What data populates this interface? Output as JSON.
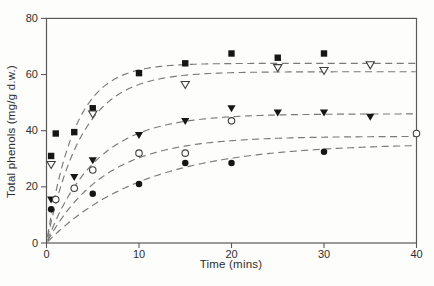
{
  "figure": {
    "x_axis_label": "Time (mins)",
    "y_axis_label": "Total phenols (mg/g d.w.)"
  },
  "chart_data": {
    "type": "scatter",
    "title": "",
    "xlabel": "Time (mins)",
    "ylabel": "Total phenols (mg/g d.w.)",
    "xlim": [
      0,
      40
    ],
    "ylim": [
      0,
      80
    ],
    "xticks": [
      0,
      10,
      20,
      30,
      40
    ],
    "yticks": [
      0,
      20,
      40,
      60,
      80
    ],
    "grid": false,
    "framed": true,
    "legend": "none",
    "curve_style": "dashed",
    "fit_model": "y = A * (1 - exp(-k * x))",
    "series": [
      {
        "name": "filled-square-series",
        "marker": "square",
        "fill": "filled",
        "points": [
          [
            0.5,
            31
          ],
          [
            1,
            39
          ],
          [
            3,
            39.5
          ],
          [
            5,
            48
          ],
          [
            10,
            60.5
          ],
          [
            15,
            64
          ],
          [
            20,
            67.5
          ],
          [
            25,
            66
          ],
          [
            30,
            67.5
          ]
        ],
        "fit": {
          "A": 64,
          "k": 0.33
        }
      },
      {
        "name": "open-triangle-down-series",
        "marker": "triangle-down",
        "fill": "open",
        "points": [
          [
            0.5,
            28
          ],
          [
            5,
            46
          ],
          [
            15,
            56.5
          ],
          [
            25,
            62.5
          ],
          [
            30,
            61.5
          ],
          [
            35,
            63.5
          ]
        ],
        "fit": {
          "A": 61,
          "k": 0.26
        }
      },
      {
        "name": "filled-triangle-down-series",
        "marker": "triangle-down",
        "fill": "filled",
        "points": [
          [
            0.5,
            15.5
          ],
          [
            3,
            23.5
          ],
          [
            5,
            29.5
          ],
          [
            10,
            38.5
          ],
          [
            15,
            43.5
          ],
          [
            20,
            48
          ],
          [
            25,
            46.5
          ],
          [
            30,
            46.5
          ],
          [
            35,
            45
          ]
        ],
        "fit": {
          "A": 46,
          "k": 0.19
        }
      },
      {
        "name": "open-circle-series",
        "marker": "circle",
        "fill": "open",
        "points": [
          [
            1,
            15.5
          ],
          [
            3,
            19.5
          ],
          [
            5,
            26
          ],
          [
            10,
            32
          ],
          [
            15,
            32
          ],
          [
            20,
            43.5
          ],
          [
            40,
            39
          ]
        ],
        "fit": {
          "A": 38,
          "k": 0.16
        }
      },
      {
        "name": "filled-circle-series",
        "marker": "circle",
        "fill": "filled",
        "points": [
          [
            0.5,
            12
          ],
          [
            5,
            17.5
          ],
          [
            10,
            21
          ],
          [
            15,
            28.5
          ],
          [
            20,
            28.5
          ],
          [
            30,
            32.5
          ]
        ],
        "fit": {
          "A": 35.5,
          "k": 0.095
        }
      }
    ],
    "colors": {
      "marker": "#161616",
      "open_marker_stroke": "#3d3d3d",
      "curve": "#7a7a7a",
      "axis": "#5a5a5a",
      "text": "#2e2e2e",
      "background": "#fdfdfc"
    }
  }
}
